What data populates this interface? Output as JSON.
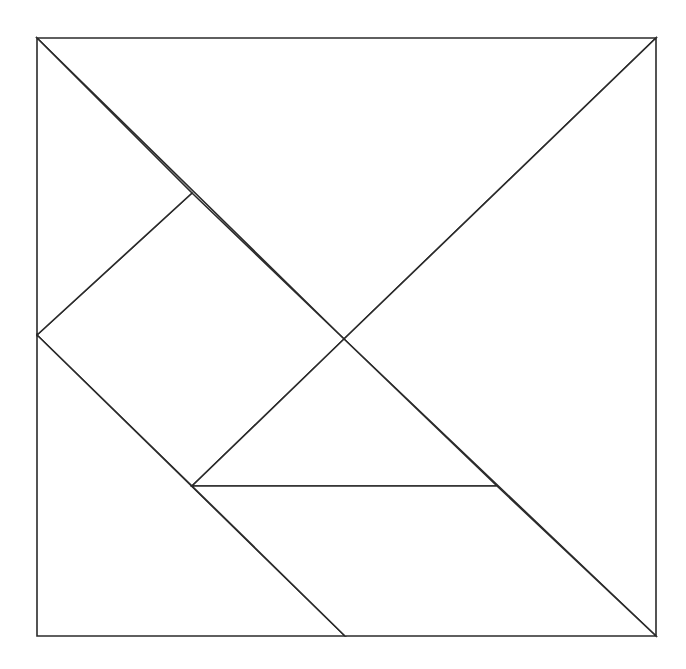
{
  "diagram": {
    "type": "tangram-square",
    "stroke_color": "#2b2b2b",
    "fill_color": "#ffffff",
    "background": "#ffffff",
    "bounds": {
      "x0": 37,
      "y0": 38,
      "x1": 656,
      "y1": 636
    },
    "pieces": [
      {
        "name": "large-triangle-top",
        "points": "37,38 656,38 344,339"
      },
      {
        "name": "large-triangle-right",
        "points": "656,38 656,636 344,339"
      },
      {
        "name": "square",
        "points": "37,335 192,193 344,339 192,486"
      },
      {
        "name": "small-triangle-top-left",
        "points": "37,38 192,193 37,335"
      },
      {
        "name": "medium-triangle-bottom-left",
        "points": "37,335 345,636 37,636"
      },
      {
        "name": "small-triangle-center",
        "points": "344,339 497,486 192,486"
      },
      {
        "name": "parallelogram-bottom",
        "points": "192,486 497,486 656,636 345,636"
      }
    ]
  }
}
